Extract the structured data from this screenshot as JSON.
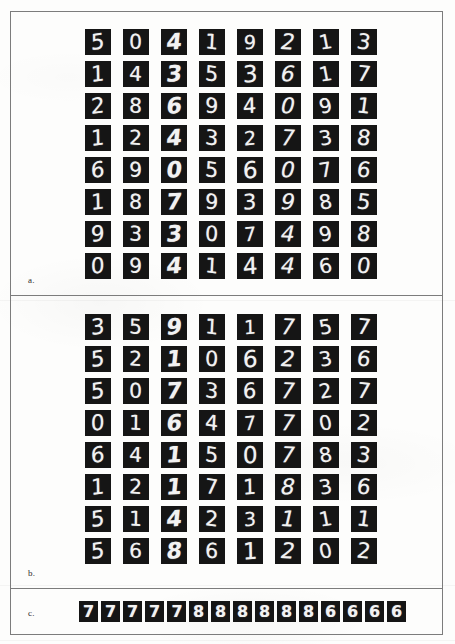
{
  "figure": {
    "panels": [
      {
        "id": "a",
        "label": "a.",
        "kind": "digit-grid",
        "rows": 8,
        "cols": 8,
        "digits": [
          [
            5,
            0,
            4,
            1,
            9,
            2,
            1,
            3
          ],
          [
            1,
            4,
            3,
            5,
            3,
            6,
            1,
            7
          ],
          [
            2,
            8,
            6,
            9,
            4,
            0,
            9,
            1
          ],
          [
            1,
            2,
            4,
            3,
            2,
            7,
            3,
            8
          ],
          [
            6,
            9,
            0,
            5,
            6,
            0,
            7,
            6
          ],
          [
            1,
            8,
            7,
            9,
            3,
            9,
            8,
            5
          ],
          [
            9,
            3,
            3,
            0,
            7,
            4,
            9,
            8
          ],
          [
            0,
            9,
            4,
            1,
            4,
            4,
            6,
            0
          ]
        ]
      },
      {
        "id": "b",
        "label": "b.",
        "kind": "digit-grid",
        "rows": 8,
        "cols": 8,
        "digits": [
          [
            3,
            5,
            9,
            1,
            1,
            7,
            5,
            7
          ],
          [
            5,
            2,
            1,
            0,
            6,
            2,
            3,
            6
          ],
          [
            5,
            0,
            7,
            3,
            6,
            7,
            2,
            7
          ],
          [
            0,
            1,
            6,
            4,
            7,
            7,
            0,
            2
          ],
          [
            6,
            4,
            1,
            5,
            0,
            7,
            8,
            3
          ],
          [
            1,
            2,
            1,
            7,
            1,
            8,
            3,
            6
          ],
          [
            5,
            1,
            4,
            2,
            3,
            1,
            1,
            1
          ],
          [
            5,
            6,
            8,
            6,
            1,
            2,
            0,
            2
          ]
        ]
      },
      {
        "id": "c",
        "label": "c.",
        "kind": "digit-strip",
        "count": 15,
        "digits": [
          7,
          7,
          7,
          7,
          7,
          8,
          8,
          8,
          8,
          8,
          8,
          6,
          6,
          6,
          6
        ]
      }
    ]
  },
  "colors": {
    "tile_background": "#151515",
    "tile_stroke": "#f2f2f2",
    "frame_line": "#7c7c7c",
    "page_background": "#fdfdfc",
    "label_text": "#2b2b2b"
  }
}
